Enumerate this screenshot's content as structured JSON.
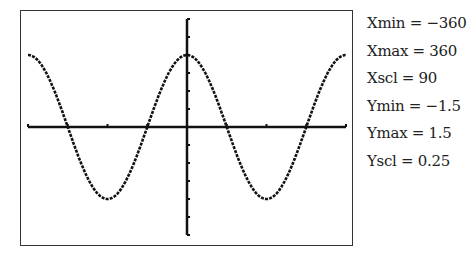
{
  "window_settings": [
    {
      "name": "Xmin",
      "eq": " = ",
      "value": "−360"
    },
    {
      "name": "Xmax",
      "eq": " = ",
      "value": "360"
    },
    {
      "name": "Xscl",
      "eq": " = ",
      "value": "90"
    },
    {
      "name": "Ymin",
      "eq": " = ",
      "value": "−1.5"
    },
    {
      "name": "Ymax",
      "eq": " = ",
      "value": "1.5"
    },
    {
      "name": "Yscl",
      "eq": " = ",
      "value": "0.25"
    }
  ],
  "colors": {
    "curve": "#111111",
    "axes": "#111111",
    "frame": "#333333"
  },
  "chart_data": {
    "type": "line",
    "title": "",
    "function": "y = cos(x)",
    "xlabel": "",
    "ylabel": "",
    "xlim": [
      -360,
      360
    ],
    "ylim": [
      -1.5,
      1.5
    ],
    "x_scale": 90,
    "y_scale": 0.25,
    "grid": false,
    "legend": null,
    "series": [
      {
        "name": "cos(x)",
        "x": [
          -360,
          -315,
          -270,
          -225,
          -180,
          -135,
          -90,
          -45,
          0,
          45,
          90,
          135,
          180,
          225,
          270,
          315,
          360
        ],
        "values": [
          1,
          0.707,
          0,
          -0.707,
          -1,
          -0.707,
          0,
          0.707,
          1,
          0.707,
          0,
          -0.707,
          -1,
          -0.707,
          0,
          0.707,
          1
        ]
      }
    ]
  }
}
